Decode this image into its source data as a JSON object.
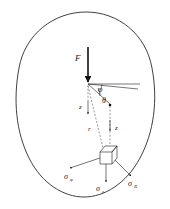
{
  "figure": {
    "background_color": "#ffffff",
    "line_color": "#1a1a1a",
    "outline_color": "#2a2a2a"
  },
  "labels": {
    "force": "F",
    "angle_phi": "φ",
    "angle_theta": "θ",
    "coord_z_left": "z",
    "coord_r": "r",
    "coord_z_right": "z",
    "sigma_phi": "σ",
    "sigma_phi_sub": "φ",
    "sigma_z": "σ",
    "sigma_z_sub": "z",
    "sigma_R": "σ",
    "sigma_R_sub": "R"
  },
  "elements": {
    "body_outline_name": "elastic-body-outline",
    "force_arrow_name": "force-arrow-F",
    "stress_cube_name": "stress-element-cube",
    "horizontal_reference_name": "horizontal-reference-line",
    "radial_line_name": "radial-line-R",
    "depth_axis_name": "depth-axis-z"
  }
}
